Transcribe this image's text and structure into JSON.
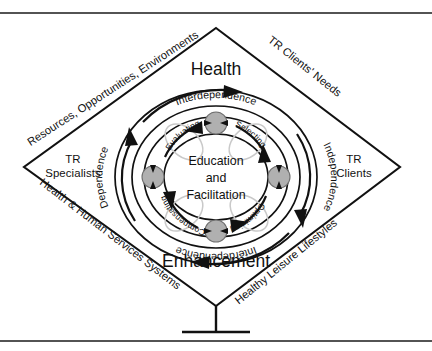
{
  "figure": {
    "top_rule": true,
    "bottom_rule": true,
    "center": {
      "line1": "Education",
      "line2": "and",
      "line3": "Facilitation"
    },
    "vertical_axis": {
      "top_label": "Health",
      "bottom_label": "Enhancement"
    },
    "diamond_corners": {
      "left": {
        "line1": "TR",
        "line2": "Specialists"
      },
      "right": {
        "line1": "TR",
        "line2": "Clients"
      }
    },
    "diamond_edges": [
      {
        "id": "top-left",
        "label": "Resources, Opportunities, Environments"
      },
      {
        "id": "top-right",
        "label": "TR Clients' Needs"
      },
      {
        "id": "bottom-left",
        "label": "Health & Human Services Systems"
      },
      {
        "id": "bottom-right",
        "label": "Healthy Leisure Lifestyles"
      }
    ],
    "outer_ring_labels": [
      {
        "id": "top",
        "label": "Interdependence"
      },
      {
        "id": "right",
        "label": "Independence"
      },
      {
        "id": "bottom",
        "label": "Interdependence"
      },
      {
        "id": "left",
        "label": "Dependence"
      }
    ],
    "process_labels": [
      {
        "id": "selecting",
        "label": "Selecting"
      },
      {
        "id": "optimizing",
        "label": "Optimizing"
      },
      {
        "id": "compensating",
        "label": "Compensating"
      },
      {
        "id": "evaluating",
        "label": "Evaluating"
      }
    ],
    "nodes": [
      {
        "id": "node-top",
        "position": "top"
      },
      {
        "id": "node-right",
        "position": "right"
      },
      {
        "id": "node-bottom",
        "position": "bottom"
      },
      {
        "id": "node-left",
        "position": "left"
      }
    ],
    "colors": {
      "stroke": "#111111",
      "node_fill": "#b0b0b0",
      "petal_stroke": "#c9c9c9",
      "background": "#ffffff"
    }
  }
}
